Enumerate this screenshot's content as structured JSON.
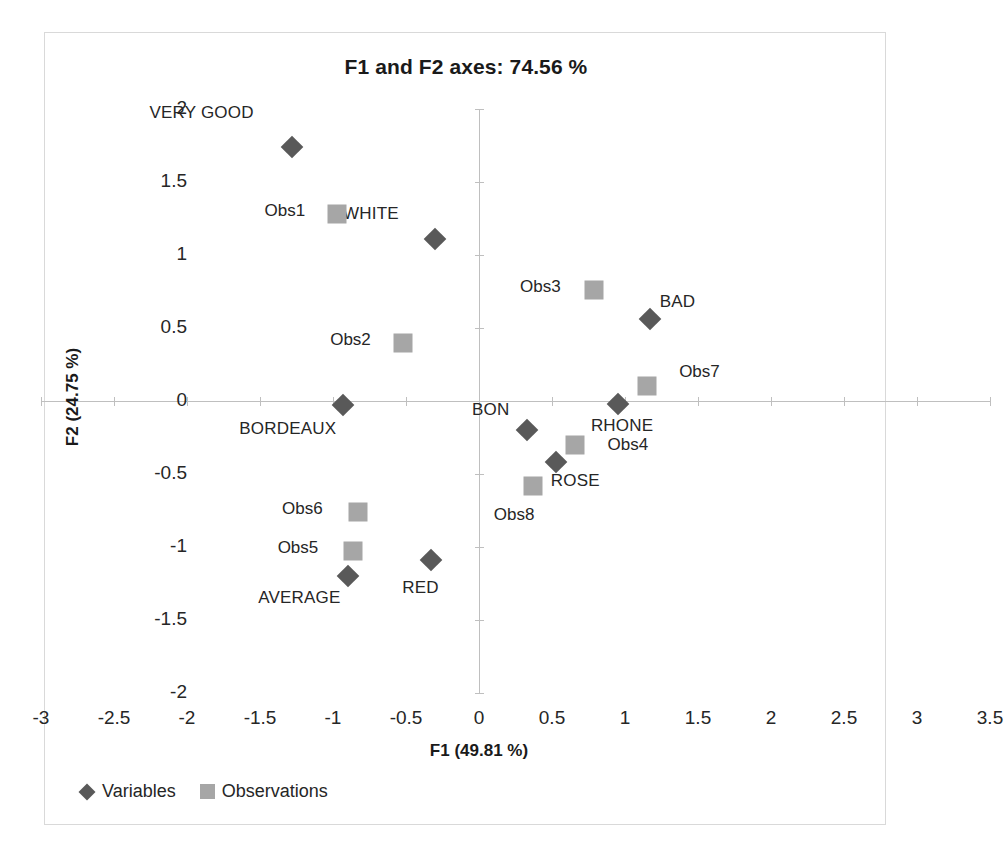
{
  "chart_data": {
    "type": "scatter",
    "title": "F1 and F2 axes: 74.56 %",
    "xlabel": "F1 (49.81 %)",
    "ylabel": "F2 (24.75 %)",
    "xlim": [
      -3,
      3.5
    ],
    "ylim": [
      -2,
      2
    ],
    "xticks": [
      "-3",
      "-2.5",
      "-2",
      "-1.5",
      "-1",
      "-0.5",
      "0",
      "0.5",
      "1",
      "1.5",
      "2",
      "2.5",
      "3",
      "3.5"
    ],
    "xtick_values": [
      -3,
      -2.5,
      -2,
      -1.5,
      -1,
      -0.5,
      0,
      0.5,
      1,
      1.5,
      2,
      2.5,
      3,
      3.5
    ],
    "yticks": [
      "2",
      "1.5",
      "1",
      "0.5",
      "0",
      "-0.5",
      "-1",
      "-1.5",
      "-2"
    ],
    "ytick_values": [
      2,
      1.5,
      1,
      0.5,
      0,
      -0.5,
      -1,
      -1.5,
      -2
    ],
    "grid": false,
    "legend_position": "bottom-left",
    "series": [
      {
        "name": "Variables",
        "marker": "diamond",
        "color": "#595959",
        "points": [
          {
            "label": "VERY GOOD",
            "x": -1.28,
            "y": 1.74,
            "label_dx": -0.62,
            "label_dy": 0.23
          },
          {
            "label": "WHITE",
            "x": -0.3,
            "y": 1.11,
            "label_dx": -0.44,
            "label_dy": 0.17
          },
          {
            "label": "BAD",
            "x": 1.17,
            "y": 0.56,
            "label_dx": 0.19,
            "label_dy": 0.12
          },
          {
            "label": "BORDEAUX",
            "x": -0.93,
            "y": -0.03,
            "label_dx": -0.38,
            "label_dy": -0.16
          },
          {
            "label": "RHONE",
            "x": 0.95,
            "y": -0.02,
            "label_dx": 0.03,
            "label_dy": -0.15
          },
          {
            "label": "BON",
            "x": 0.33,
            "y": -0.2,
            "label_dx": -0.25,
            "label_dy": 0.14
          },
          {
            "label": "ROSE",
            "x": 0.53,
            "y": -0.42,
            "label_dx": 0.13,
            "label_dy": -0.13
          },
          {
            "label": "AVERAGE",
            "x": -0.9,
            "y": -1.2,
            "label_dx": -0.33,
            "label_dy": -0.15
          },
          {
            "label": "RED",
            "x": -0.33,
            "y": -1.09,
            "label_dx": -0.07,
            "label_dy": -0.19
          }
        ]
      },
      {
        "name": "Observations",
        "marker": "square",
        "color": "#a6a6a6",
        "points": [
          {
            "label": "Obs1",
            "x": -0.97,
            "y": 1.28,
            "label_dx": -0.36,
            "label_dy": 0.02
          },
          {
            "label": "Obs2",
            "x": -0.52,
            "y": 0.4,
            "label_dx": -0.36,
            "label_dy": 0.02
          },
          {
            "label": "Obs3",
            "x": 0.79,
            "y": 0.76,
            "label_dx": -0.37,
            "label_dy": 0.02
          },
          {
            "label": "Obs4",
            "x": 0.66,
            "y": -0.3,
            "label_dx": 0.36,
            "label_dy": 0.0
          },
          {
            "label": "Obs5",
            "x": -0.86,
            "y": -1.03,
            "label_dx": -0.38,
            "label_dy": 0.02
          },
          {
            "label": "Obs6",
            "x": -0.83,
            "y": -0.76,
            "label_dx": -0.38,
            "label_dy": 0.02
          },
          {
            "label": "Obs7",
            "x": 1.15,
            "y": 0.1,
            "label_dx": 0.36,
            "label_dy": 0.1
          },
          {
            "label": "Obs8",
            "x": 0.37,
            "y": -0.58,
            "label_dx": -0.13,
            "label_dy": -0.2
          }
        ]
      }
    ]
  },
  "legend": {
    "entries": [
      {
        "label": "Variables",
        "marker": "diamond"
      },
      {
        "label": "Observations",
        "marker": "square"
      }
    ]
  }
}
